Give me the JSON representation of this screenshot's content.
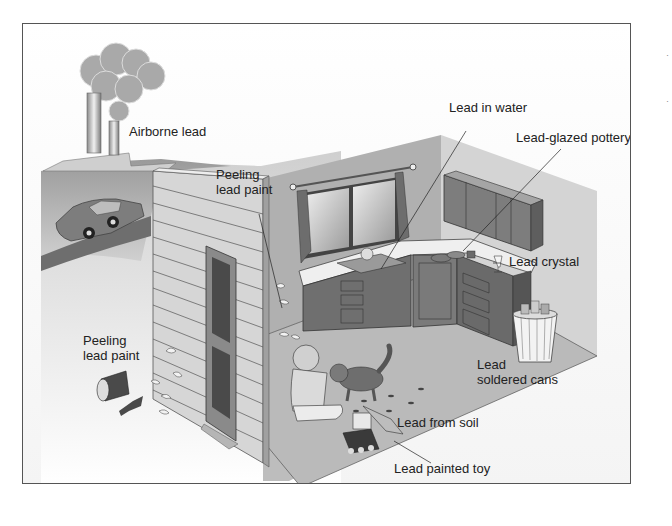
{
  "figure": {
    "labels": {
      "airborne_lead": "Airborne lead",
      "peeling_paint_interior": "Peeling\nlead paint",
      "peeling_paint_interior_l1": "Peeling",
      "peeling_paint_interior_l2": "lead paint",
      "peeling_paint_exterior_l1": "Peeling",
      "peeling_paint_exterior_l2": "lead paint",
      "lead_in_water": "Lead in water",
      "lead_glazed_pottery": "Lead-glazed pottery",
      "lead_crystal": "Lead crystal",
      "lead_soldered_cans_l1": "Lead",
      "lead_soldered_cans_l2": "soldered cans",
      "lead_from_soil": "Lead from soil",
      "lead_painted_toy": "Lead painted toy"
    },
    "depicted_items": [
      "factory-smokestacks",
      "smoke-cloud",
      "car",
      "house-siding-wall",
      "door",
      "window-with-curtains",
      "kitchen-sink",
      "kitchen-cabinets",
      "pottery-dishes",
      "crystal-glass",
      "trash-can-with-cans",
      "child",
      "cat",
      "toy-bulldozer",
      "bucket-and-shovel",
      "paint-chips"
    ],
    "colors": {
      "border": "#555555",
      "wall_light": "#d9d9d9",
      "wall_dark": "#a8a8a8",
      "floor": "#bdbdbd",
      "cabinet": "#7a7a7a",
      "text": "#222222"
    }
  }
}
